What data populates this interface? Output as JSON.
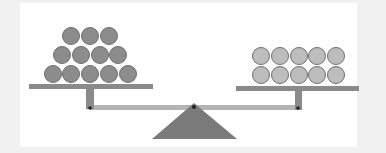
{
  "diagram": {
    "type": "balance-scale",
    "colors": {
      "background": "#f1f1f1",
      "panel": "#ffffff",
      "left_circle_fill": "#8c8c8c",
      "right_circle_fill": "#bdbdbd",
      "circle_stroke": "#6e6e6e",
      "pan": "#8a8a8a",
      "rod": "#b3b3b3",
      "fulcrum": "#7a7a7a",
      "pivot": "#222222"
    },
    "left_pan": {
      "rows": [
        3,
        4,
        5
      ],
      "count": 12,
      "arrangement": "pyramid"
    },
    "right_pan": {
      "rows": [
        5,
        5
      ],
      "count": 10,
      "arrangement": "grid"
    }
  }
}
